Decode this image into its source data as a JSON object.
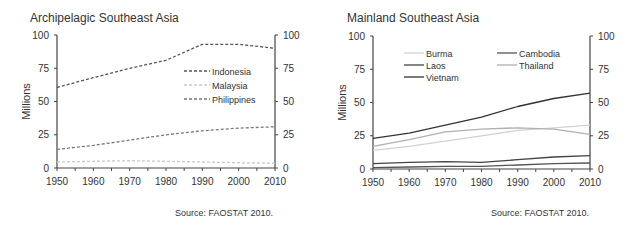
{
  "chart_data": [
    {
      "type": "line",
      "title": "Archipelagic Southeast Asia",
      "xlabel": "",
      "ylabel": "Millions",
      "x": [
        1950,
        1960,
        1970,
        1980,
        1990,
        2000,
        2010
      ],
      "xlim": [
        1950,
        2010
      ],
      "ylim": [
        0,
        100
      ],
      "yticks": [
        0,
        25,
        50,
        75,
        100
      ],
      "secondary_y_axis": true,
      "grid": false,
      "legend_position": "upper right, inside",
      "series": [
        {
          "name": "Indonesia",
          "style": "dashed",
          "color": "#555555",
          "values": [
            60.5,
            68,
            75,
            81,
            93,
            93,
            90
          ]
        },
        {
          "name": "Malaysia",
          "style": "dashed",
          "color": "#c8c8c8",
          "values": [
            4.5,
            5,
            5.5,
            5,
            4.5,
            4,
            3.5
          ]
        },
        {
          "name": "Philippines",
          "style": "dashed",
          "color": "#777777",
          "values": [
            14,
            17,
            21,
            25,
            28,
            30,
            31
          ]
        }
      ],
      "source": "Source: FAOSTAT 2010."
    },
    {
      "type": "line",
      "title": "Mainland Southeast Asia",
      "xlabel": "",
      "ylabel": "Millions",
      "x": [
        1950,
        1960,
        1970,
        1980,
        1990,
        2000,
        2010
      ],
      "xlim": [
        1950,
        2010
      ],
      "ylim": [
        0,
        100
      ],
      "yticks": [
        0,
        25,
        50,
        75,
        100
      ],
      "secondary_y_axis": true,
      "grid": false,
      "legend_position": "upper left, inside, two columns",
      "series": [
        {
          "name": "Burma",
          "style": "solid",
          "color": "#d2d2d2",
          "values": [
            14,
            17,
            21,
            25,
            29,
            31,
            33
          ]
        },
        {
          "name": "Cambodia",
          "style": "solid",
          "color": "#555555",
          "values": [
            1,
            1.5,
            2,
            2,
            3,
            4,
            4.5
          ]
        },
        {
          "name": "Laos",
          "style": "solid",
          "color": "#444444",
          "values": [
            4,
            5,
            5.5,
            5,
            7,
            9,
            10
          ]
        },
        {
          "name": "Thailand",
          "style": "solid",
          "color": "#b0b0b0",
          "values": [
            17,
            22,
            28,
            30,
            31,
            30,
            26
          ]
        },
        {
          "name": "Vietnam",
          "style": "solid",
          "color": "#333333",
          "values": [
            23,
            27,
            33,
            39,
            47,
            53,
            57
          ]
        }
      ],
      "source": "Source: FAOSTAT 2010."
    }
  ],
  "panels": {
    "left": {
      "title": "Archipelagic Southeast Asia",
      "ylabel": "Millions",
      "source": "Source: FAOSTAT 2010."
    },
    "right": {
      "title": "Mainland Southeast Asia",
      "ylabel": "Millions",
      "source": "Source: FAOSTAT 2010."
    }
  }
}
